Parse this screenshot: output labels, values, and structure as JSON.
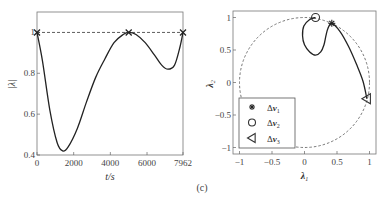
{
  "caption": "(c)",
  "chart_data": [
    {
      "type": "line",
      "title": "",
      "xlabel": "t/s",
      "ylabel": "|λ|",
      "xlim": [
        0,
        7962
      ],
      "ylim": [
        0.4,
        1.1
      ],
      "xticks": [
        0,
        2000,
        4000,
        6000,
        7962
      ],
      "xtick_labels": [
        "0",
        "2000",
        "4000",
        "6000",
        "7962"
      ],
      "yticks": [
        0.4,
        0.6,
        0.8,
        1.0
      ],
      "ytick_labels": [
        "0.4",
        "0.6",
        "0.8",
        "1"
      ],
      "grid": false,
      "series": [
        {
          "name": "|λ|",
          "style": "solid",
          "x": [
            0,
            300,
            700,
            1100,
            1400,
            1700,
            2200,
            2700,
            3200,
            3700,
            4200,
            4700,
            5000,
            5400,
            5900,
            6400,
            6800,
            7140,
            7500,
            7800,
            7962
          ],
          "y": [
            1.0,
            0.86,
            0.62,
            0.46,
            0.42,
            0.44,
            0.53,
            0.66,
            0.78,
            0.87,
            0.95,
            0.99,
            1.0,
            0.99,
            0.95,
            0.89,
            0.84,
            0.82,
            0.84,
            0.93,
            1.0
          ]
        },
        {
          "name": "reference",
          "style": "dashed",
          "x": [
            0,
            7962
          ],
          "y": [
            1.0,
            1.0
          ]
        }
      ],
      "markers": [
        {
          "x": 0,
          "y": 1.0,
          "symbol": "x"
        },
        {
          "x": 5000,
          "y": 1.0,
          "symbol": "x"
        },
        {
          "x": 7962,
          "y": 1.0,
          "symbol": "x"
        }
      ]
    },
    {
      "type": "line",
      "title": "",
      "xlabel": "λ1",
      "ylabel": "λ2",
      "xlim": [
        -1.1,
        1.1
      ],
      "ylim": [
        -1.1,
        1.1
      ],
      "xticks": [
        -1,
        -0.5,
        0,
        0.5,
        1
      ],
      "xtick_labels": [
        "-1",
        "-0.5",
        "0",
        "0.5",
        "1"
      ],
      "yticks": [
        -1,
        -0.5,
        0,
        0.5,
        1
      ],
      "ytick_labels": [
        "-1",
        "-0.5",
        "0",
        "0.5",
        "1"
      ],
      "grid": false,
      "unit_circle": {
        "style": "dashed",
        "radius": 1
      },
      "series": [
        {
          "name": "trajectory",
          "style": "solid",
          "x": [
            0.17,
            0.08,
            -0.01,
            -0.03,
            0.0,
            0.08,
            0.17,
            0.25,
            0.3,
            0.33,
            0.36,
            0.42,
            0.55,
            0.68,
            0.8,
            0.9,
            0.96
          ],
          "y": [
            1.0,
            0.97,
            0.87,
            0.72,
            0.58,
            0.47,
            0.42,
            0.47,
            0.58,
            0.72,
            0.83,
            0.91,
            0.78,
            0.55,
            0.28,
            0.02,
            -0.25
          ]
        }
      ],
      "markers": [
        {
          "label": "Δv1",
          "symbol": "asterisk",
          "x": 0.42,
          "y": 0.91
        },
        {
          "label": "Δv2",
          "symbol": "circle",
          "x": 0.17,
          "y": 1.0
        },
        {
          "label": "Δv3",
          "symbol": "triangle-left",
          "x": 0.96,
          "y": -0.25
        }
      ],
      "legend": {
        "placement": "bottom-left",
        "entries": [
          {
            "symbol": "asterisk",
            "label_base": "Δ",
            "label_var": "v",
            "label_sub": "1"
          },
          {
            "symbol": "circle",
            "label_base": "Δ",
            "label_var": "v",
            "label_sub": "2"
          },
          {
            "symbol": "triangle-left",
            "label_base": "Δ",
            "label_var": "v",
            "label_sub": "3"
          }
        ]
      }
    }
  ]
}
